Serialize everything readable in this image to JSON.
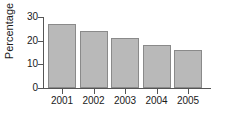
{
  "chart_data": {
    "type": "bar",
    "title": "",
    "xlabel": "",
    "ylabel": "Percentage",
    "categories": [
      "2001",
      "2002",
      "2003",
      "2004",
      "2005"
    ],
    "values": [
      27,
      24,
      21,
      18,
      16
    ],
    "ylim": [
      0,
      32
    ],
    "yticks": [
      0,
      10,
      20,
      30
    ],
    "ytick_labels": [
      "0",
      "10",
      "20",
      "30"
    ],
    "grid": false,
    "legend": null,
    "bar_color": "#b9b9b9",
    "bar_border_color": "#8a8a8a",
    "axis_color": "#555555",
    "text_color": "#1a1a1a"
  }
}
